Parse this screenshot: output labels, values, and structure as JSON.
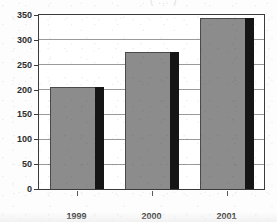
{
  "header": {
    "clipped_text": "( ... )"
  },
  "chart_data": {
    "type": "bar",
    "title": "",
    "subtitle": "",
    "xlabel": "",
    "ylabel": "",
    "categories": [
      "1999",
      "2000",
      "2001"
    ],
    "values": [
      205,
      275,
      343
    ],
    "series": [
      {
        "name": "",
        "values": [
          205,
          275,
          343
        ]
      }
    ],
    "ylim": [
      0,
      350
    ],
    "yticks": [
      0,
      50,
      100,
      150,
      200,
      250,
      300,
      350
    ],
    "ytick_labels": [
      "0",
      "50",
      "100",
      "150",
      "200",
      "250",
      "300",
      "350"
    ],
    "grid": true,
    "legend": false,
    "legend_position": "none",
    "bar_color": "#8c8c8c",
    "bar_shadow_color": "#151515",
    "axis_color": "#3b3b3b",
    "gridline_color": "#9a9a9a",
    "background_color": "#ffffff",
    "annotations": []
  }
}
